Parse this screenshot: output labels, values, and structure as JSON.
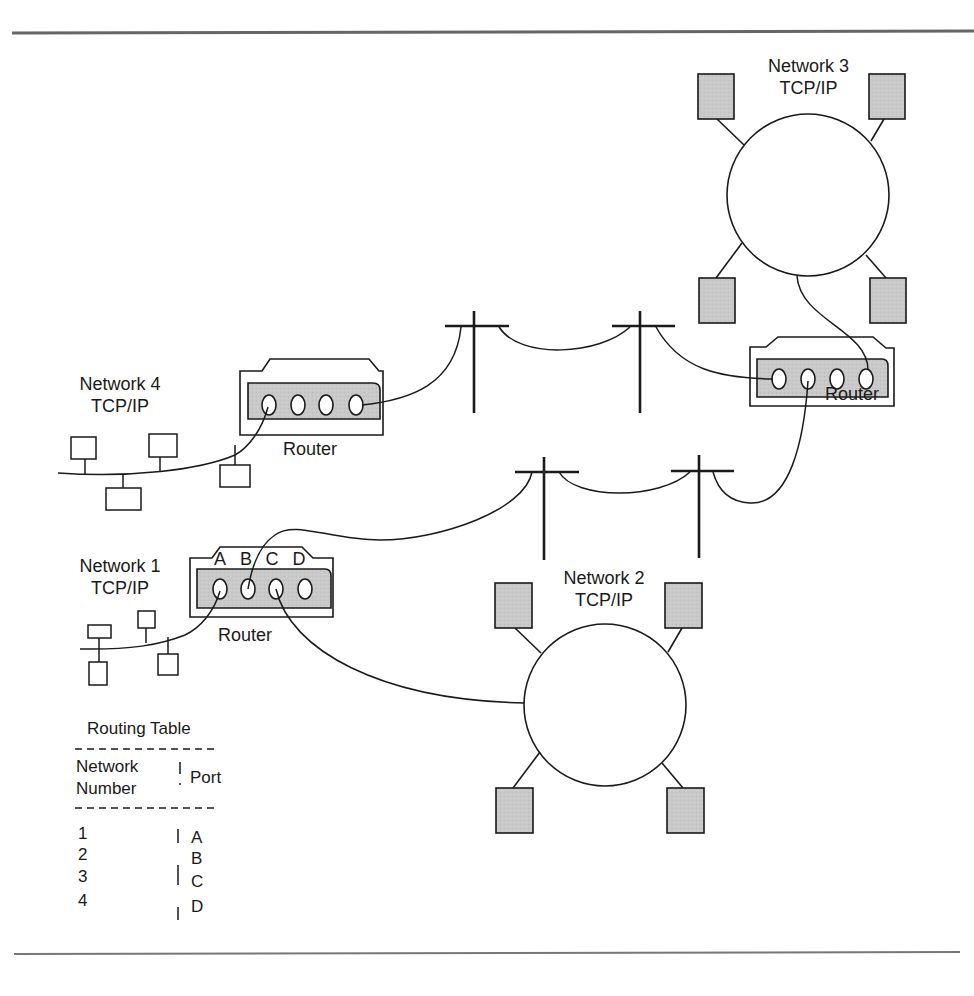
{
  "colors": {
    "ink": "#1a1a1a",
    "frame_rule": "#666666",
    "node_fill": "#c8c8c8",
    "router_panel_fill": "#cccccc",
    "background": "#ffffff"
  },
  "networks": [
    {
      "id": "network-1",
      "name": "Network 1",
      "protocol": "TCP/IP",
      "topology": "bus"
    },
    {
      "id": "network-2",
      "name": "Network 2",
      "protocol": "TCP/IP",
      "topology": "ring"
    },
    {
      "id": "network-3",
      "name": "Network 3",
      "protocol": "TCP/IP",
      "topology": "ring"
    },
    {
      "id": "network-4",
      "name": "Network 4",
      "protocol": "TCP/IP",
      "topology": "bus"
    }
  ],
  "routers": [
    {
      "id": "router-network-1",
      "label": "Router",
      "ports": [
        "A",
        "B",
        "C",
        "D"
      ],
      "port_labels_shown": true
    },
    {
      "id": "router-network-4",
      "label": "Router",
      "port_labels_shown": false
    },
    {
      "id": "router-network-3",
      "label": "Router",
      "port_labels_shown": false
    }
  ],
  "routing_table": {
    "title": "Routing Table",
    "headers": {
      "network_line1": "Network",
      "network_line2": "Number",
      "port": "Port"
    },
    "rows": [
      {
        "network": "1",
        "port": "A"
      },
      {
        "network": "2",
        "port": "B"
      },
      {
        "network": "3",
        "port": "C"
      },
      {
        "network": "4",
        "port": "D"
      }
    ]
  },
  "icons": {
    "pole": "telephone-pole-icon",
    "host": "host-computer-icon",
    "router": "router-icon"
  }
}
